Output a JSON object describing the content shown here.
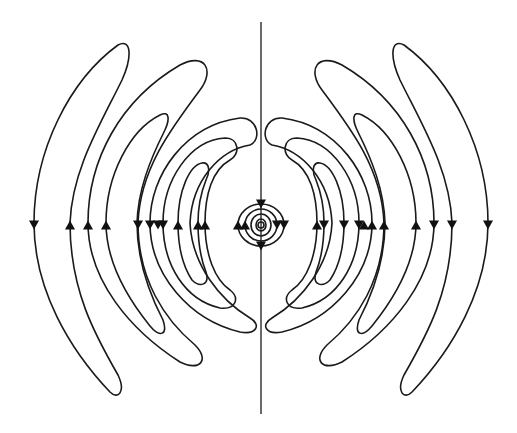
{
  "diagram": {
    "colors": {
      "line": "#1a1a1a",
      "background": "#ffffff"
    },
    "elements": {
      "dipole_axis": "vertical dipole axis",
      "near_field_loops": 4,
      "left_lobes": 7,
      "right_lobes": 7
    },
    "arrow_directions_on_equator": {
      "left": [
        "down",
        "up",
        "up",
        "up",
        "down",
        "down",
        "down",
        "down",
        "up",
        "up",
        "up"
      ],
      "right": [
        "down",
        "down",
        "down",
        "up",
        "up",
        "up",
        "up",
        "down",
        "down",
        "down",
        "up"
      ]
    }
  }
}
